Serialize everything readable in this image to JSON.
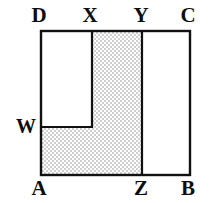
{
  "figure": {
    "kind": "geometry-diagram",
    "stroke_color": "#111111",
    "shade_color": "#d8d8d8",
    "background_color": "#ffffff",
    "stroke_width": 2.2,
    "square": {
      "left": 41,
      "top": 31,
      "right": 190,
      "bottom": 175
    },
    "points": {
      "A": {
        "x": 41,
        "y": 175
      },
      "B": {
        "x": 190,
        "y": 175
      },
      "C": {
        "x": 190,
        "y": 31
      },
      "D": {
        "x": 41,
        "y": 31
      },
      "W": {
        "x": 41,
        "y": 127
      },
      "X": {
        "x": 92,
        "y": 31
      },
      "Y": {
        "x": 142,
        "y": 31
      },
      "Z": {
        "x": 142,
        "y": 175
      }
    },
    "segments": [
      {
        "name": "side-DC",
        "from": "D",
        "to": "C"
      },
      {
        "name": "side-CB",
        "from": "C",
        "to": "B"
      },
      {
        "name": "side-BA",
        "from": "B",
        "to": "A"
      },
      {
        "name": "side-AD",
        "from": "A",
        "to": "D"
      },
      {
        "name": "segment-XW-vertical",
        "from": "X",
        "to": "Wx"
      },
      {
        "name": "segment-WX-horizontal",
        "from": "W",
        "to": "Wx"
      },
      {
        "name": "segment-YZ",
        "from": "Y",
        "to": "Z"
      }
    ],
    "shaded_polygon": {
      "name": "region-AWXYZ",
      "vertices": [
        "A",
        "W",
        "Xbase",
        "X",
        "Y",
        "Z"
      ],
      "path_points": "41,175 41,127 92,127 92,31 142,31 142,175"
    },
    "labels": [
      {
        "id": "D",
        "text": "D",
        "position": "top-left"
      },
      {
        "id": "X",
        "text": "X",
        "position": "top"
      },
      {
        "id": "Y",
        "text": "Y",
        "position": "top"
      },
      {
        "id": "C",
        "text": "C",
        "position": "top-right"
      },
      {
        "id": "W",
        "text": "W",
        "position": "left"
      },
      {
        "id": "A",
        "text": "A",
        "position": "bottom-left"
      },
      {
        "id": "Z",
        "text": "Z",
        "position": "bottom"
      },
      {
        "id": "B",
        "text": "B",
        "position": "bottom-right"
      }
    ]
  }
}
